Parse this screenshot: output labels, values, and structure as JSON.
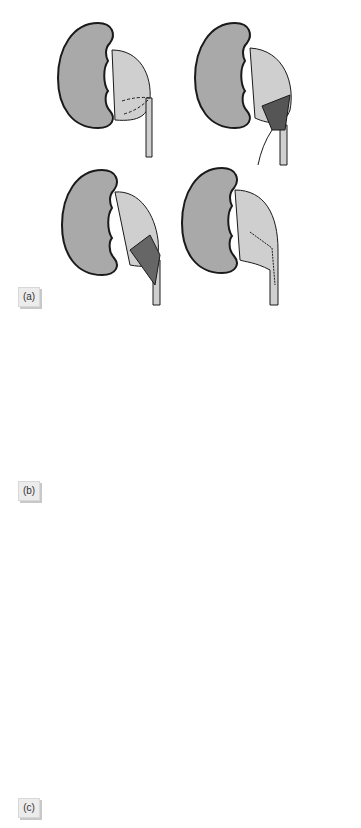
{
  "figure": {
    "colors": {
      "kidney_fill": "#a9a9a9",
      "pelvis_fill": "#cfcfcf",
      "outline": "#1a1a1a",
      "background": "#ffffff",
      "label_bg": "#ececec"
    },
    "panels": [
      {
        "label": "(a)",
        "steps": 4,
        "description": "Flap pyeloplasty: incision lines, flap raised, flap sutured, completed repair"
      },
      {
        "label": "(b)",
        "steps": 3,
        "description": "Spiral flap pyeloplasty: outlined flap, flap rotated, completed suture line"
      },
      {
        "label": "(c)",
        "steps": 5,
        "description": "Dismembered pyeloplasty with stent: dilated pelvis, pelvis excised, anastomosis, stent placed, completed"
      }
    ]
  }
}
